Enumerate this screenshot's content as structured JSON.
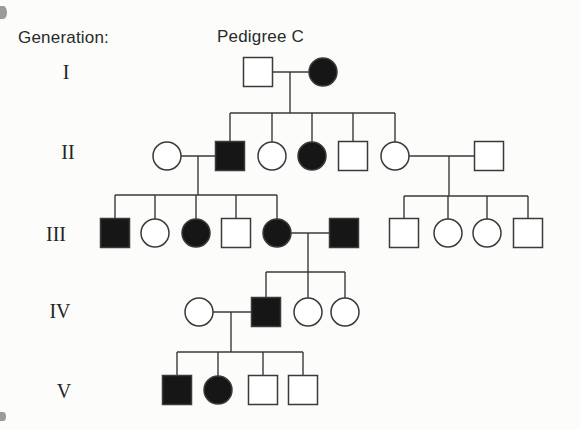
{
  "figure": {
    "generation_label": "Generation:",
    "title": "Pedigree C",
    "background": "#fcfcfa",
    "line_color": "#3a3a3a",
    "affected_fill": "#161616",
    "unaffected_fill": "#ffffff"
  },
  "pedigree": {
    "generations": [
      {
        "numeral": "I",
        "label_x": 66,
        "label_y": 79
      },
      {
        "numeral": "II",
        "label_x": 68,
        "label_y": 159
      },
      {
        "numeral": "III",
        "label_x": 56,
        "label_y": 241
      },
      {
        "numeral": "IV",
        "label_x": 60,
        "label_y": 318
      },
      {
        "numeral": "V",
        "label_x": 64,
        "label_y": 398
      }
    ],
    "individuals": [
      {
        "id": "I-1",
        "generation": "I",
        "sex": "male",
        "affected": false,
        "x": 258,
        "y": 72
      },
      {
        "id": "I-2",
        "generation": "I",
        "sex": "female",
        "affected": true,
        "x": 323,
        "y": 72
      },
      {
        "id": "II-1",
        "generation": "II",
        "sex": "female",
        "affected": false,
        "x": 167,
        "y": 156
      },
      {
        "id": "II-2",
        "generation": "II",
        "sex": "male",
        "affected": true,
        "x": 230,
        "y": 156
      },
      {
        "id": "II-3",
        "generation": "II",
        "sex": "female",
        "affected": false,
        "x": 272,
        "y": 156
      },
      {
        "id": "II-4",
        "generation": "II",
        "sex": "female",
        "affected": true,
        "x": 312,
        "y": 156
      },
      {
        "id": "II-5",
        "generation": "II",
        "sex": "male",
        "affected": false,
        "x": 353,
        "y": 156
      },
      {
        "id": "II-6",
        "generation": "II",
        "sex": "female",
        "affected": false,
        "x": 395,
        "y": 156
      },
      {
        "id": "II-7",
        "generation": "II",
        "sex": "male",
        "affected": false,
        "x": 489,
        "y": 156
      },
      {
        "id": "III-1",
        "generation": "III",
        "sex": "male",
        "affected": true,
        "x": 115,
        "y": 233
      },
      {
        "id": "III-2",
        "generation": "III",
        "sex": "female",
        "affected": false,
        "x": 155,
        "y": 233
      },
      {
        "id": "III-3",
        "generation": "III",
        "sex": "female",
        "affected": true,
        "x": 196,
        "y": 233
      },
      {
        "id": "III-4",
        "generation": "III",
        "sex": "male",
        "affected": false,
        "x": 236,
        "y": 233
      },
      {
        "id": "III-5",
        "generation": "III",
        "sex": "female",
        "affected": true,
        "x": 277,
        "y": 233
      },
      {
        "id": "III-6",
        "generation": "III",
        "sex": "male",
        "affected": true,
        "x": 344,
        "y": 233
      },
      {
        "id": "III-7",
        "generation": "III",
        "sex": "male",
        "affected": false,
        "x": 404,
        "y": 233
      },
      {
        "id": "III-8",
        "generation": "III",
        "sex": "female",
        "affected": false,
        "x": 448,
        "y": 233
      },
      {
        "id": "III-9",
        "generation": "III",
        "sex": "female",
        "affected": false,
        "x": 487,
        "y": 233
      },
      {
        "id": "III-10",
        "generation": "III",
        "sex": "male",
        "affected": false,
        "x": 528,
        "y": 233
      },
      {
        "id": "IV-1",
        "generation": "IV",
        "sex": "female",
        "affected": false,
        "x": 199,
        "y": 312
      },
      {
        "id": "IV-2",
        "generation": "IV",
        "sex": "male",
        "affected": true,
        "x": 266,
        "y": 312
      },
      {
        "id": "IV-3",
        "generation": "IV",
        "sex": "female",
        "affected": false,
        "x": 308,
        "y": 312
      },
      {
        "id": "IV-4",
        "generation": "IV",
        "sex": "female",
        "affected": false,
        "x": 345,
        "y": 312
      },
      {
        "id": "V-1",
        "generation": "V",
        "sex": "male",
        "affected": true,
        "x": 177,
        "y": 390
      },
      {
        "id": "V-2",
        "generation": "V",
        "sex": "female",
        "affected": true,
        "x": 218,
        "y": 390
      },
      {
        "id": "V-3",
        "generation": "V",
        "sex": "male",
        "affected": false,
        "x": 263,
        "y": 390
      },
      {
        "id": "V-4",
        "generation": "V",
        "sex": "male",
        "affected": false,
        "x": 303,
        "y": 390
      }
    ],
    "unions": [
      {
        "partners": [
          "I-1",
          "I-2"
        ],
        "drop_x": 290,
        "sibline_y": 113,
        "children": [
          "II-2",
          "II-3",
          "II-4",
          "II-5",
          "II-6"
        ]
      },
      {
        "partners": [
          "II-1",
          "II-2"
        ],
        "drop_x": 198,
        "sibline_y": 195,
        "children": [
          "III-1",
          "III-2",
          "III-3",
          "III-4",
          "III-5"
        ]
      },
      {
        "partners": [
          "II-6",
          "II-7"
        ],
        "drop_x": 449,
        "sibline_y": 196,
        "children": [
          "III-7",
          "III-8",
          "III-9",
          "III-10"
        ]
      },
      {
        "partners": [
          "III-5",
          "III-6"
        ],
        "drop_x": 308,
        "sibline_y": 272,
        "children": [
          "IV-2",
          "IV-3",
          "IV-4"
        ]
      },
      {
        "partners": [
          "IV-1",
          "IV-2"
        ],
        "drop_x": 231,
        "sibline_y": 352,
        "children": [
          "V-1",
          "V-2",
          "V-3",
          "V-4"
        ]
      }
    ],
    "symbol": {
      "square_side": 29,
      "circle_radius": 14
    },
    "scan_artifacts": [
      {
        "x": 0,
        "y": 6,
        "w": 7,
        "h": 13
      },
      {
        "x": 0,
        "y": 412,
        "w": 6,
        "h": 9
      }
    ]
  }
}
